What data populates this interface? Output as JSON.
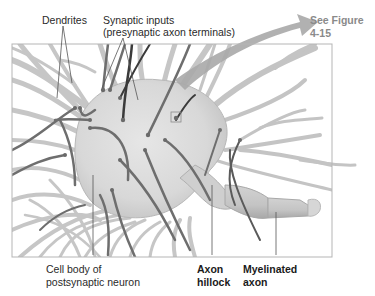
{
  "diagram": {
    "labels": {
      "dendrites": "Dendrites",
      "synaptic_inputs_line1": "Synaptic inputs",
      "synaptic_inputs_line2": "(presynaptic axon terminals)",
      "see_figure_line1": "See Figure",
      "see_figure_line2": "4-15",
      "cell_body_line1": "Cell body of",
      "cell_body_line2": "postsynaptic neuron",
      "axon_hillock_line1": "Axon",
      "axon_hillock_line2": "hillock",
      "myelinated_axon_line1": "Myelinated",
      "myelinated_axon_line2": "axon"
    },
    "colors": {
      "frame": "#b5b5b5",
      "cell_body": "#dcdcdc",
      "dendrite": "#c4c4c4",
      "dendrite_edge": "#a8a8a8",
      "axon_terminal": "#6e6e6e",
      "axon_terminal_dark": "#3a3a3a",
      "arrow": "#a9a9a9",
      "leader_line": "#555555"
    }
  }
}
